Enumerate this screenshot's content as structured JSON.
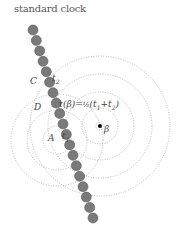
{
  "diagram": {
    "title": "standard clock",
    "labels": {
      "C": "C",
      "t2": "t",
      "t2_sub": "2",
      "D": "D",
      "tau_eq": "τ(β)=",
      "half": "½",
      "tsum_open": "(t",
      "t1_sub_a": "1",
      "plus": "+t",
      "t2_sub_b": "2",
      "tsum_close": ")",
      "A": "A",
      "t1": "t",
      "t1_sub": "1",
      "beta": "β"
    },
    "colors": {
      "bead": "#7a7a7a",
      "bead_stroke": "#5a5a5a",
      "circle": "#aaaaaa",
      "point": "#000000"
    },
    "beads": {
      "start": [
        33,
        30
      ],
      "end": [
        93,
        218
      ],
      "count": 19,
      "radius": 5
    },
    "beta_point": [
      100,
      126
    ],
    "beta_circles": [
      18,
      34,
      52,
      70
    ],
    "A_point": [
      57,
      140
    ],
    "A_circles": [
      14,
      30,
      46
    ]
  }
}
